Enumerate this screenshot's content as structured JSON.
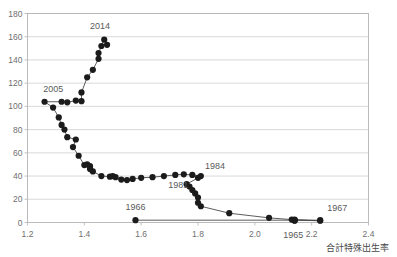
{
  "chart_data": {
    "type": "scatter",
    "title": "",
    "subtitle": "",
    "xlabel": "合計特殊出生率",
    "ylabel": "",
    "xlim": [
      1.2,
      2.4
    ],
    "ylim": [
      0,
      180
    ],
    "xticks": [
      "1.2",
      "1.4",
      "1.6",
      "1.8",
      "2.0",
      "2.2",
      "2.4"
    ],
    "xtick_values": [
      1.2,
      1.4,
      1.6,
      1.8,
      2.0,
      2.2,
      2.4
    ],
    "yticks": [
      "0",
      "20",
      "40",
      "60",
      "80",
      "100",
      "120",
      "140",
      "160",
      "180"
    ],
    "ytick_values": [
      0,
      20,
      40,
      60,
      80,
      100,
      120,
      140,
      160,
      180
    ],
    "grid": "horizontal",
    "legend": "none",
    "marker_color": "#1b1b1b",
    "line_color": "#4a4a4a",
    "grid_color": "#c9c9c9",
    "frame_color": "#b4b4b4",
    "series": [
      {
        "name": "main",
        "points": [
          [
            2.14,
            1.5
          ],
          [
            2.14,
            2.0
          ],
          [
            2.23,
            1.5
          ],
          [
            2.14,
            2.5
          ],
          [
            2.13,
            2.5
          ],
          [
            2.05,
            4.0
          ],
          [
            1.91,
            8.0
          ],
          [
            1.81,
            14.0
          ],
          [
            1.8,
            17.0
          ],
          [
            1.8,
            21.5
          ],
          [
            1.79,
            25.0
          ],
          [
            1.78,
            28.0
          ],
          [
            1.77,
            31.0
          ],
          [
            1.76,
            33.0
          ],
          [
            1.8,
            38.5
          ],
          [
            1.81,
            40.0
          ],
          [
            1.78,
            41.0
          ],
          [
            1.75,
            41.5
          ],
          [
            1.72,
            41.0
          ],
          [
            1.68,
            40.0
          ],
          [
            1.64,
            39.0
          ],
          [
            1.6,
            38.5
          ],
          [
            1.57,
            37.5
          ],
          [
            1.55,
            36.5
          ],
          [
            1.53,
            37.0
          ],
          [
            1.51,
            39.0
          ],
          [
            1.5,
            40.0
          ],
          [
            1.49,
            39.5
          ],
          [
            1.46,
            40.0
          ],
          [
            1.43,
            44.0
          ],
          [
            1.42,
            46.0
          ],
          [
            1.42,
            48.5
          ],
          [
            1.41,
            50.0
          ],
          [
            1.4,
            49.5
          ],
          [
            1.38,
            57.5
          ],
          [
            1.36,
            65.0
          ],
          [
            1.37,
            71.5
          ],
          [
            1.34,
            73.5
          ],
          [
            1.33,
            80.0
          ],
          [
            1.32,
            84.0
          ],
          [
            1.31,
            90.5
          ],
          [
            1.29,
            99.0
          ],
          [
            1.26,
            104.0
          ],
          [
            1.32,
            104.0
          ],
          [
            1.34,
            103.5
          ],
          [
            1.37,
            105.0
          ],
          [
            1.39,
            104.5
          ],
          [
            1.39,
            112.0
          ],
          [
            1.41,
            125.0
          ],
          [
            1.43,
            131.5
          ],
          [
            1.45,
            141.0
          ],
          [
            1.45,
            146.0
          ],
          [
            1.46,
            152.0
          ],
          [
            1.47,
            157.5
          ],
          [
            1.48,
            153.0
          ]
        ]
      },
      {
        "name": "baseline",
        "points": [
          [
            1.58,
            2.0
          ],
          [
            2.14,
            2.0
          ],
          [
            2.23,
            2.0
          ]
        ]
      }
    ],
    "annotations": [
      {
        "text": "2014",
        "x": 1.455,
        "y": 167.0,
        "anchor": "middle"
      },
      {
        "text": "2005",
        "x": 1.255,
        "y": 112.0,
        "anchor": "start"
      },
      {
        "text": "1981",
        "x": 1.695,
        "y": 30.0,
        "anchor": "start"
      },
      {
        "text": "1984",
        "x": 1.825,
        "y": 46.0,
        "anchor": "start"
      },
      {
        "text": "1966",
        "x": 1.545,
        "y": 11.0,
        "anchor": "start"
      },
      {
        "text": "1967",
        "x": 2.255,
        "y": 10.0,
        "anchor": "start"
      },
      {
        "text": "1965",
        "x": 2.135,
        "y": -13.0,
        "anchor": "middle"
      }
    ]
  }
}
